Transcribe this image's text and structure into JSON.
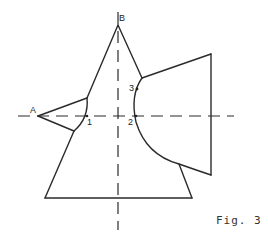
{
  "figure": {
    "caption": "Fig. 3",
    "stroke_color": "#2a2a2a",
    "background_color": "#ffffff"
  },
  "labels": {
    "point_a": "A",
    "point_b": "B",
    "point_1": "1",
    "point_2": "2",
    "point_3": "3"
  }
}
